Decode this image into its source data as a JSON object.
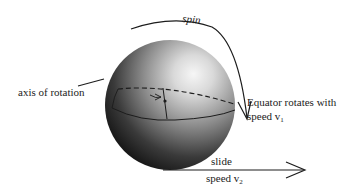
{
  "diagram": {
    "type": "physics-illustration"
  },
  "labels": {
    "spin": "spin",
    "axis_of_rotation": "axis of rotation",
    "equator_line1": "Equator rotates with",
    "equator_line2_prefix": "speed v",
    "equator_line2_sub": "1",
    "slide": "slide",
    "slide_speed_prefix": "speed v",
    "slide_speed_sub": "2"
  },
  "colors": {
    "ink": "#1c1c1c",
    "sphere_highlight": "#f4f4f4",
    "sphere_mid": "#8a8a8a",
    "sphere_shadow": "#050505",
    "background": "#ffffff"
  }
}
